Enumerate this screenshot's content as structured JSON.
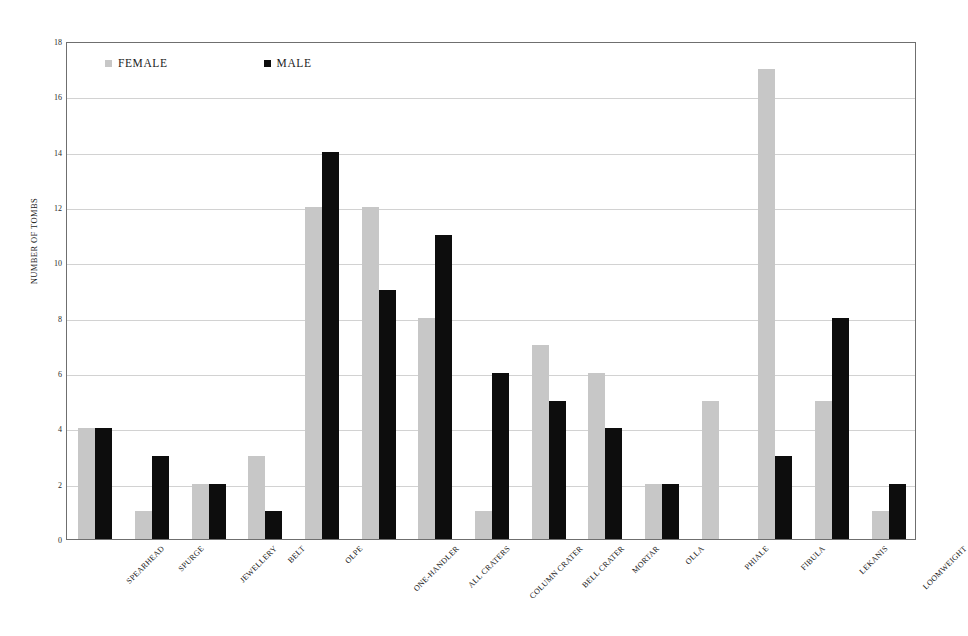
{
  "chart_data": {
    "type": "bar",
    "title": "",
    "xlabel": "",
    "ylabel": "NUMBER OF TOMBS",
    "ylim": [
      0,
      18
    ],
    "ytick_step": 2,
    "yticks": [
      18,
      16,
      14,
      12,
      10,
      8,
      6,
      4,
      2,
      0
    ],
    "grid": true,
    "legend_position": "top-left-inside",
    "categories": [
      "SPEARHEAD",
      "SPURGE",
      "JEWELLERY",
      "BELT",
      "OLPE",
      "ONE-HANDLER",
      "ALL CRATERS",
      "COLUMN CRATER",
      "BELL CRATER",
      "MORTAR",
      "OLLA",
      "PHIALE",
      "FIBULA",
      "LEKANIS",
      "LOOMWEIGHT"
    ],
    "series": [
      {
        "name": "FEMALE",
        "color": "#c7c7c7",
        "values": [
          4,
          1,
          2,
          3,
          12,
          12,
          8,
          1,
          7,
          6,
          2,
          5,
          17,
          5,
          1
        ]
      },
      {
        "name": "MALE",
        "color": "#0d0d0d",
        "values": [
          4,
          3,
          2,
          1,
          14,
          9,
          11,
          6,
          5,
          4,
          2,
          0,
          3,
          8,
          2
        ]
      }
    ]
  },
  "axis": {
    "y_title": "NUMBER OF TOMBS"
  },
  "legend": {
    "entries": [
      {
        "label": "FEMALE",
        "color": "#c7c7c7"
      },
      {
        "label": "MALE",
        "color": "#0d0d0d"
      }
    ]
  }
}
